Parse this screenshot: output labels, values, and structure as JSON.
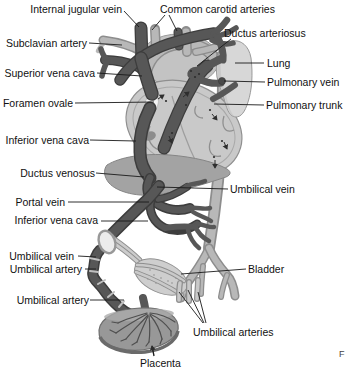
{
  "labels": [
    {
      "id": "internal-jugular-vein",
      "text": "Internal jugular vein"
    },
    {
      "id": "common-carotid-arteries",
      "text": "Common carotid arteries"
    },
    {
      "id": "subclavian-artery",
      "text": "Subclavian artery"
    },
    {
      "id": "ductus-arteriosus",
      "text": "Ductus arteriosus"
    },
    {
      "id": "lung",
      "text": "Lung"
    },
    {
      "id": "superior-vena-cava",
      "text": "Superior vena cava"
    },
    {
      "id": "pulmonary-vein",
      "text": "Pulmonary vein"
    },
    {
      "id": "foramen-ovale",
      "text": "Foramen ovale"
    },
    {
      "id": "pulmonary-trunk",
      "text": "Pulmonary trunk"
    },
    {
      "id": "inferior-vena-cava-upper",
      "text": "Inferior vena cava"
    },
    {
      "id": "ductus-venosus",
      "text": "Ductus venosus"
    },
    {
      "id": "umbilical-vein-right",
      "text": "Umbilical vein"
    },
    {
      "id": "portal-vein",
      "text": "Portal vein"
    },
    {
      "id": "inferior-vena-cava-lower",
      "text": "Inferior vena cava"
    },
    {
      "id": "umbilical-vein-left",
      "text": "Umbilical vein"
    },
    {
      "id": "umbilical-artery-upper",
      "text": "Umbilical artery"
    },
    {
      "id": "bladder",
      "text": "Bladder"
    },
    {
      "id": "umbilical-artery-lower",
      "text": "Umbilical artery"
    },
    {
      "id": "umbilical-arteries",
      "text": "Umbilical arteries"
    },
    {
      "id": "placenta",
      "text": "Placenta"
    }
  ],
  "corner_mark": "F",
  "colors": {
    "background": "#ffffff",
    "vein_dark": "#575757",
    "vein_outline": "#3d3d3d",
    "artery_light": "#b8b8b8",
    "artery_outline": "#8d8d8d",
    "heart_fill": "#c9c9c9",
    "lung_fill": "#d7d7d7",
    "liver_fill": "#a3a3a3",
    "bladder_fill": "#cecece",
    "placenta_fill": "#989898",
    "label_text": "#111111",
    "leader_line": "#1a1a1a"
  }
}
